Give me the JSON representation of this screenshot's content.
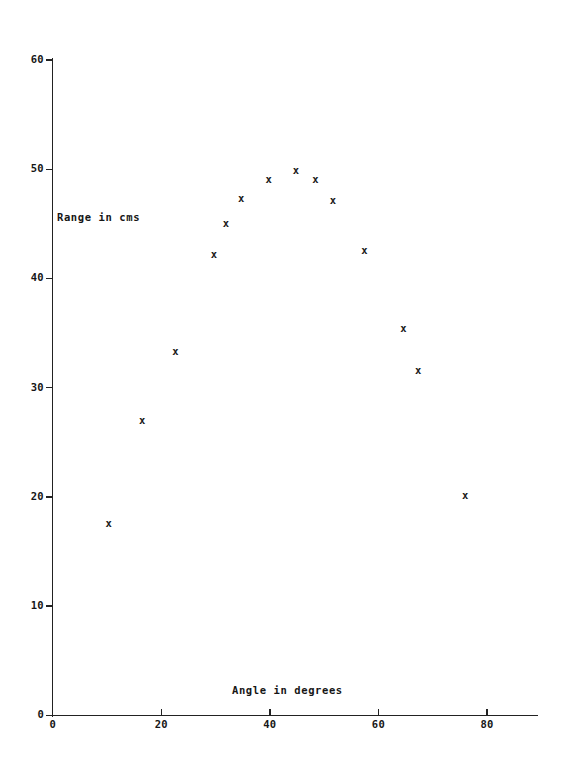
{
  "chart_data": {
    "type": "scatter",
    "title": "",
    "xlabel": "Angle in degrees",
    "ylabel": "Range in cms",
    "xlim": [
      0,
      89
    ],
    "ylim": [
      0,
      60
    ],
    "xticks": [
      0,
      20,
      40,
      60,
      80
    ],
    "yticks": [
      0,
      10,
      20,
      30,
      40,
      50,
      60
    ],
    "xtick_labels": [
      "0",
      "20",
      "40",
      "60",
      "80"
    ],
    "ytick_labels": [
      "0",
      "10",
      "20",
      "30",
      "40",
      "50",
      "60"
    ],
    "grid": false,
    "legend": null,
    "marker": "x",
    "marker_color": "#1b1b1b",
    "series": [
      {
        "name": "Projectile range",
        "points": [
          {
            "x": 10.3,
            "y": 17.6
          },
          {
            "x": 16.5,
            "y": 27.0
          },
          {
            "x": 22.6,
            "y": 33.4
          },
          {
            "x": 29.7,
            "y": 42.2
          },
          {
            "x": 31.9,
            "y": 45.1
          },
          {
            "x": 34.7,
            "y": 47.4
          },
          {
            "x": 39.8,
            "y": 49.1
          },
          {
            "x": 44.8,
            "y": 49.9
          },
          {
            "x": 48.4,
            "y": 49.1
          },
          {
            "x": 51.6,
            "y": 47.2
          },
          {
            "x": 57.4,
            "y": 42.6
          },
          {
            "x": 64.6,
            "y": 35.5
          },
          {
            "x": 67.3,
            "y": 31.6
          },
          {
            "x": 76.0,
            "y": 20.2
          }
        ]
      }
    ]
  }
}
